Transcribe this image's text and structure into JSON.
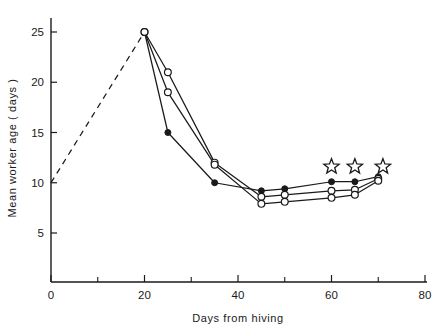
{
  "chart_data": {
    "type": "line",
    "title": "",
    "xlabel": "Days from hiving",
    "ylabel": "Mean worker age ( days )",
    "xlim": [
      0,
      80
    ],
    "ylim": [
      0,
      27
    ],
    "grid": false,
    "legend": "none",
    "x_ticks_major": [
      0,
      20,
      40,
      60,
      80
    ],
    "x_ticks_minor": [
      10,
      30,
      50,
      70
    ],
    "y_ticks_major": [
      5,
      10,
      15,
      20,
      25
    ],
    "series": [
      {
        "name": "colony-a-filled-circles",
        "marker": "filled-circle",
        "x": [
          20,
          25,
          35,
          45,
          50,
          60,
          65,
          70
        ],
        "values": [
          25,
          15,
          10,
          9.2,
          9.4,
          10.1,
          10.1,
          10.6
        ]
      },
      {
        "name": "colony-b-open-circles-upper",
        "marker": "open-circle",
        "x": [
          20,
          25,
          35,
          45,
          50,
          60,
          65,
          70
        ],
        "values": [
          25,
          21,
          12,
          8.6,
          8.8,
          9.2,
          9.3,
          10.4
        ]
      },
      {
        "name": "colony-c-open-circles-lower",
        "marker": "open-circle",
        "x": [
          20,
          25,
          35,
          45,
          50,
          60,
          65,
          70
        ],
        "values": [
          25,
          19,
          11.8,
          7.9,
          8.1,
          8.5,
          8.8,
          10.2
        ]
      }
    ],
    "dashed_segment": {
      "name": "extrapolated-rise",
      "style": "dashed",
      "x": [
        0,
        20
      ],
      "values": [
        10,
        25
      ]
    },
    "star_annotations": {
      "marker": "star-outline",
      "x": [
        60,
        65,
        71
      ],
      "values": [
        11.6,
        11.6,
        11.6
      ]
    }
  },
  "axes": {
    "x_tick_labels": [
      "0",
      "20",
      "40",
      "60",
      "80"
    ],
    "y_tick_labels": [
      "5",
      "10",
      "15",
      "20",
      "25"
    ],
    "x_axis_title": "Days from hiving",
    "y_axis_title": "Mean worker age ( days )"
  },
  "colors": {
    "ink": "#1a1a1a",
    "background": "#ffffff"
  }
}
